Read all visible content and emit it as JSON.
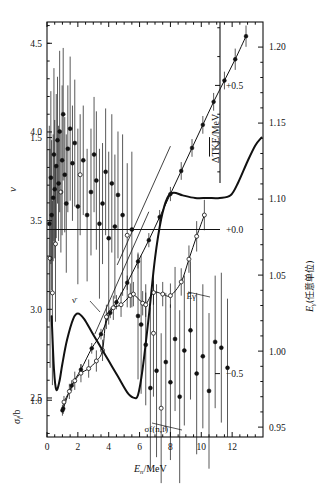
{
  "figure": {
    "caption_title": "",
    "background": "#ffffff",
    "ink": "#111111"
  },
  "axes": {
    "x": {
      "label_main": "E",
      "label_sub": "n",
      "label_tail": "/MeV",
      "label_full": "E_n/MeV",
      "ticks": [
        "0",
        "2",
        "4",
        "6",
        "8",
        "10",
        "12"
      ],
      "tick_values": [
        0,
        2,
        4,
        6,
        8,
        10,
        12
      ],
      "range": [
        0,
        14
      ],
      "minor_step": 0.5
    },
    "left_upper": {
      "label": "ν",
      "label_name": "nu",
      "ticks": [
        "4.5",
        "4.0",
        "3.5",
        "3.0",
        "2.5"
      ],
      "tick_values": [
        4.5,
        4.0,
        3.5,
        3.0,
        2.5
      ],
      "range": [
        2.28,
        4.62
      ],
      "minor_step": 0.1
    },
    "left_lower": {
      "label_main": "σ",
      "label_sub": "f",
      "label_tail": "/b",
      "label_full": "σ_f/b",
      "ticks": [
        "1.5",
        "1.0"
      ],
      "tick_values": [
        1.5,
        1.0
      ],
      "range": [
        0.93,
        1.72
      ],
      "minor_step": 0.1
    },
    "inner_right": {
      "label": "ΔTKE/MeV",
      "label_base": "Δ",
      "label_over": "TKE",
      "label_tail": "/MeV",
      "ticks": [
        "+0.5",
        "+0.0",
        "−0.5"
      ],
      "tick_values": [
        0.5,
        0.0,
        -0.5
      ],
      "range": [
        -0.72,
        0.72
      ],
      "minor_step": 0.1
    },
    "right": {
      "label_main": "E",
      "label_sub": "γ",
      "label_tail": "(任意单位)",
      "label_full": "E_γ(任意单位)",
      "ticks": [
        "1.20",
        "1.15",
        "1.10",
        "1.05",
        "1.00",
        "0.95"
      ],
      "tick_values": [
        1.2,
        1.15,
        1.1,
        1.05,
        1.0,
        0.95
      ],
      "range": [
        0.9435,
        1.2165
      ],
      "minor_step": 0.01
    }
  },
  "annotations": [
    {
      "name": "nu-bar-label",
      "text": "ν̄",
      "x": 76,
      "y": 303,
      "leader_to_x": 100,
      "leader_to_y": 312
    },
    {
      "name": "e-gamma-bar-label",
      "text": "Ēγ",
      "x": 196,
      "y": 299,
      "leader_to_x": 188,
      "leader_to_y": 292
    },
    {
      "name": "sigma-f-nf-label",
      "text": "σf(n,f)",
      "x": 168,
      "y": 432,
      "leader_to_x": 152,
      "leader_to_y": 423
    }
  ],
  "chart_data": {
    "type": "scatter",
    "title": "",
    "xlabel": "E_n/MeV",
    "ylabel": "ν  /  σ_f/b",
    "y2label": "ΔTKE/MeV  /  E_γ(任意单位)",
    "xlim": [
      0,
      14
    ],
    "grid": false,
    "legend": "inline-annotations",
    "series": [
      {
        "name": "ΔTKE/MeV",
        "axis": "inner_right",
        "type": "scatter-errorbar",
        "marker": "filled-and-open-circles",
        "note": "dense scatter scattering about 0.0 for E_n<6 MeV, dropping to about -0.4 above 6 MeV",
        "points": [
          {
            "x": 0.15,
            "y": 0.02,
            "e": 0.34,
            "open": false
          },
          {
            "x": 0.2,
            "y": -0.1,
            "e": 0.38,
            "open": true
          },
          {
            "x": 0.25,
            "y": 0.18,
            "e": 0.3,
            "open": false
          },
          {
            "x": 0.3,
            "y": 0.05,
            "e": 0.26,
            "open": false
          },
          {
            "x": 0.35,
            "y": -0.22,
            "e": 0.32,
            "open": true
          },
          {
            "x": 0.4,
            "y": 0.11,
            "e": 0.22,
            "open": false
          },
          {
            "x": 0.45,
            "y": 0.26,
            "e": 0.3,
            "open": false
          },
          {
            "x": 0.5,
            "y": 0.14,
            "e": 0.24,
            "open": false
          },
          {
            "x": 0.55,
            "y": -0.05,
            "e": 0.27,
            "open": true
          },
          {
            "x": 0.6,
            "y": 0.22,
            "e": 0.25,
            "open": false
          },
          {
            "x": 0.68,
            "y": 0.31,
            "e": 0.22,
            "open": false
          },
          {
            "x": 0.75,
            "y": 0.16,
            "e": 0.2,
            "open": false
          },
          {
            "x": 0.82,
            "y": 0.34,
            "e": 0.28,
            "open": false
          },
          {
            "x": 0.9,
            "y": 0.13,
            "e": 0.21,
            "open": true
          },
          {
            "x": 0.98,
            "y": 0.24,
            "e": 0.26,
            "open": false
          },
          {
            "x": 1.05,
            "y": 0.4,
            "e": 0.23,
            "open": false
          },
          {
            "x": 1.15,
            "y": 0.19,
            "e": 0.2,
            "open": false
          },
          {
            "x": 1.25,
            "y": 0.09,
            "e": 0.24,
            "open": false
          },
          {
            "x": 1.35,
            "y": 0.28,
            "e": 0.22,
            "open": false
          },
          {
            "x": 1.5,
            "y": 0.35,
            "e": 0.25,
            "open": false
          },
          {
            "x": 1.65,
            "y": 0.23,
            "e": 0.2,
            "open": false
          },
          {
            "x": 1.8,
            "y": 0.3,
            "e": 0.22,
            "open": false
          },
          {
            "x": 2.0,
            "y": 0.08,
            "e": 0.27,
            "open": false
          },
          {
            "x": 2.15,
            "y": 0.19,
            "e": 0.21,
            "open": true
          },
          {
            "x": 2.35,
            "y": 0.24,
            "e": 0.19,
            "open": false
          },
          {
            "x": 2.6,
            "y": 0.05,
            "e": 0.23,
            "open": false
          },
          {
            "x": 2.85,
            "y": 0.13,
            "e": 0.22,
            "open": false
          },
          {
            "x": 3.05,
            "y": 0.26,
            "e": 0.2,
            "open": false
          },
          {
            "x": 3.2,
            "y": 0.17,
            "e": 0.24,
            "open": false
          },
          {
            "x": 3.4,
            "y": 0.02,
            "e": 0.26,
            "open": false
          },
          {
            "x": 3.6,
            "y": 0.09,
            "e": 0.21,
            "open": false
          },
          {
            "x": 3.8,
            "y": 0.2,
            "e": 0.22,
            "open": false
          },
          {
            "x": 4.0,
            "y": -0.03,
            "e": 0.3,
            "open": false
          },
          {
            "x": 4.2,
            "y": 0.16,
            "e": 0.24,
            "open": false
          },
          {
            "x": 4.4,
            "y": 0.01,
            "e": 0.25,
            "open": false
          },
          {
            "x": 4.6,
            "y": 0.12,
            "e": 0.22,
            "open": false
          },
          {
            "x": 4.9,
            "y": 0.05,
            "e": 0.28,
            "open": false
          },
          {
            "x": 5.2,
            "y": -0.02,
            "e": 0.25,
            "open": true
          },
          {
            "x": 5.5,
            "y": 0.0,
            "e": 0.27,
            "open": false
          },
          {
            "x": 5.9,
            "y": -0.3,
            "e": 0.22,
            "open": false
          },
          {
            "x": 6.1,
            "y": -0.33,
            "e": 0.24,
            "open": false
          },
          {
            "x": 6.4,
            "y": -0.4,
            "e": 0.21,
            "open": false
          },
          {
            "x": 6.7,
            "y": -0.55,
            "e": 0.28,
            "open": false
          },
          {
            "x": 6.9,
            "y": -0.36,
            "e": 0.22,
            "open": true
          },
          {
            "x": 7.1,
            "y": -0.49,
            "e": 0.3,
            "open": false
          },
          {
            "x": 7.4,
            "y": -0.62,
            "e": 0.26,
            "open": true
          },
          {
            "x": 7.7,
            "y": -0.46,
            "e": 0.24,
            "open": false
          },
          {
            "x": 8.0,
            "y": -0.53,
            "e": 0.27,
            "open": false
          },
          {
            "x": 8.3,
            "y": -0.38,
            "e": 0.25,
            "open": false
          },
          {
            "x": 8.6,
            "y": -0.58,
            "e": 0.3,
            "open": false
          },
          {
            "x": 8.9,
            "y": -0.42,
            "e": 0.26,
            "open": false
          },
          {
            "x": 9.3,
            "y": -0.35,
            "e": 0.24,
            "open": false
          },
          {
            "x": 9.7,
            "y": -0.5,
            "e": 0.28,
            "open": false
          },
          {
            "x": 10.1,
            "y": -0.44,
            "e": 0.25,
            "open": false
          },
          {
            "x": 10.5,
            "y": -0.56,
            "e": 0.27,
            "open": false
          },
          {
            "x": 10.9,
            "y": -0.39,
            "e": 0.23,
            "open": false
          },
          {
            "x": 11.3,
            "y": -0.41,
            "e": 0.26,
            "open": false
          },
          {
            "x": 11.7,
            "y": -0.48,
            "e": 0.24,
            "open": false
          }
        ]
      },
      {
        "name": "ν̄",
        "axis": "left_upper",
        "type": "line-markers",
        "marker": "filled-circle",
        "note": "mean prompt neutron multiplicity, rises roughly linearly from 2.42 at 1 MeV to 4.55 at 13 MeV",
        "points": [
          {
            "x": 1.0,
            "y": 2.43,
            "e": 0.03
          },
          {
            "x": 1.05,
            "y": 2.44,
            "e": 0.03
          },
          {
            "x": 1.6,
            "y": 2.57,
            "e": 0.03
          },
          {
            "x": 2.2,
            "y": 2.66,
            "e": 0.03
          },
          {
            "x": 2.9,
            "y": 2.78,
            "e": 0.03
          },
          {
            "x": 3.5,
            "y": 2.86,
            "e": 0.03
          },
          {
            "x": 4.1,
            "y": 2.98,
            "e": 0.03
          },
          {
            "x": 4.5,
            "y": 3.04,
            "e": 0.04
          },
          {
            "x": 5.2,
            "y": 3.15,
            "e": 0.04
          },
          {
            "x": 5.9,
            "y": 3.27,
            "e": 0.04
          },
          {
            "x": 6.6,
            "y": 3.39,
            "e": 0.04
          },
          {
            "x": 7.3,
            "y": 3.52,
            "e": 0.04
          },
          {
            "x": 8.0,
            "y": 3.65,
            "e": 0.04
          },
          {
            "x": 8.7,
            "y": 3.78,
            "e": 0.05
          },
          {
            "x": 9.4,
            "y": 3.91,
            "e": 0.05
          },
          {
            "x": 10.1,
            "y": 4.04,
            "e": 0.05
          },
          {
            "x": 10.8,
            "y": 4.17,
            "e": 0.05
          },
          {
            "x": 11.5,
            "y": 4.29,
            "e": 0.05
          },
          {
            "x": 12.2,
            "y": 4.41,
            "e": 0.06
          },
          {
            "x": 12.9,
            "y": 4.54,
            "e": 0.06
          }
        ]
      },
      {
        "name": "Ēγ",
        "axis": "right",
        "type": "line-markers",
        "marker": "open-circle",
        "note": "mean prompt gamma energy in arbitrary units; rises from 0.965 at 1 MeV, plateau near 1.04 between 5 and 8 MeV, rises again above 8 MeV",
        "points": [
          {
            "x": 1.1,
            "y": 0.9665,
            "e": 0.004
          },
          {
            "x": 1.45,
            "y": 0.9735,
            "e": 0.005
          },
          {
            "x": 1.8,
            "y": 0.9805,
            "e": 0.006
          },
          {
            "x": 2.2,
            "y": 0.9855,
            "e": 0.006
          },
          {
            "x": 2.7,
            "y": 0.9885,
            "e": 0.006
          },
          {
            "x": 3.2,
            "y": 0.9935,
            "e": 0.007
          },
          {
            "x": 3.6,
            "y": 1.0005,
            "e": 0.007
          },
          {
            "x": 3.85,
            "y": 1.0225,
            "e": 0.008
          },
          {
            "x": 4.3,
            "y": 1.0285,
            "e": 0.008
          },
          {
            "x": 4.8,
            "y": 1.0305,
            "e": 0.008
          },
          {
            "x": 5.4,
            "y": 1.0365,
            "e": 0.008
          },
          {
            "x": 5.6,
            "y": 1.0375,
            "e": 0.008
          },
          {
            "x": 6.2,
            "y": 1.0315,
            "e": 0.008
          },
          {
            "x": 6.4,
            "y": 1.0305,
            "e": 0.008
          },
          {
            "x": 6.9,
            "y": 1.0385,
            "e": 0.008
          },
          {
            "x": 7.5,
            "y": 1.0375,
            "e": 0.008
          },
          {
            "x": 8.0,
            "y": 1.0365,
            "e": 0.008
          },
          {
            "x": 8.7,
            "y": 1.0455,
            "e": 0.009
          },
          {
            "x": 9.2,
            "y": 1.0605,
            "e": 0.009
          },
          {
            "x": 9.7,
            "y": 1.0755,
            "e": 0.01
          },
          {
            "x": 10.2,
            "y": 1.0895,
            "e": 0.01
          }
        ]
      },
      {
        "name": "σf(n,f)",
        "axis": "left_lower",
        "type": "line",
        "note": "fission cross-section in barns; first-chance plateau near 1.2 b at 2 MeV, dip to 1.0 b near 5.5 MeV, second-chance rise to 1.4 b at 8 MeV, third-chance rise above 12 MeV",
        "points": [
          {
            "x": 0.3,
            "y": 1.16
          },
          {
            "x": 0.45,
            "y": 1.06
          },
          {
            "x": 0.6,
            "y": 1.02
          },
          {
            "x": 0.8,
            "y": 1.035
          },
          {
            "x": 1.0,
            "y": 1.07
          },
          {
            "x": 1.3,
            "y": 1.115
          },
          {
            "x": 1.7,
            "y": 1.155
          },
          {
            "x": 2.0,
            "y": 1.165
          },
          {
            "x": 2.4,
            "y": 1.155
          },
          {
            "x": 2.9,
            "y": 1.13
          },
          {
            "x": 3.4,
            "y": 1.105
          },
          {
            "x": 4.0,
            "y": 1.075
          },
          {
            "x": 4.6,
            "y": 1.045
          },
          {
            "x": 5.2,
            "y": 1.015
          },
          {
            "x": 5.6,
            "y": 1.005
          },
          {
            "x": 5.9,
            "y": 1.01
          },
          {
            "x": 6.2,
            "y": 1.06
          },
          {
            "x": 6.6,
            "y": 1.16
          },
          {
            "x": 7.0,
            "y": 1.27
          },
          {
            "x": 7.4,
            "y": 1.345
          },
          {
            "x": 7.8,
            "y": 1.385
          },
          {
            "x": 8.2,
            "y": 1.395
          },
          {
            "x": 8.8,
            "y": 1.39
          },
          {
            "x": 9.6,
            "y": 1.385
          },
          {
            "x": 10.4,
            "y": 1.385
          },
          {
            "x": 11.2,
            "y": 1.385
          },
          {
            "x": 11.9,
            "y": 1.39
          },
          {
            "x": 12.4,
            "y": 1.415
          },
          {
            "x": 13.0,
            "y": 1.455
          },
          {
            "x": 13.5,
            "y": 1.485
          },
          {
            "x": 13.9,
            "y": 1.5
          }
        ]
      },
      {
        "name": "ΔTKE zero reference line",
        "axis": "inner_right",
        "type": "hline",
        "y": 0.0
      },
      {
        "name": "nu guide line upper",
        "axis": "left_upper",
        "type": "straight-guide",
        "from": {
          "x": 4.55,
          "y": 3.25
        },
        "to": {
          "x": 8.0,
          "y": 3.92
        }
      },
      {
        "name": "nu guide line lower",
        "axis": "left_upper",
        "type": "straight-guide",
        "from": {
          "x": 3.1,
          "y": 2.86
        },
        "to": {
          "x": 6.6,
          "y": 3.55
        }
      }
    ]
  }
}
